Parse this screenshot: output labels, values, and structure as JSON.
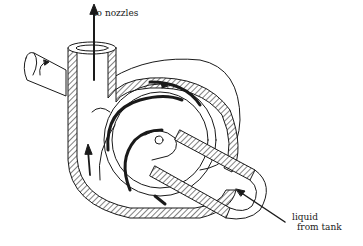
{
  "diagram": {
    "colors": {
      "ink": "#1a1a1a",
      "background": "#ffffff"
    },
    "labels": {
      "outlet": "to nozzles",
      "inlet_line1": "liquid",
      "inlet_line2": "from tank"
    },
    "components": [
      {
        "name": "drive-shaft",
        "description": "shaft entering from upper left with rotation arrow"
      },
      {
        "name": "discharge-pipe",
        "description": "vertical outlet pipe with upward flow arrow"
      },
      {
        "name": "volute-casing",
        "description": "hatched spiral casing"
      },
      {
        "name": "impeller",
        "description": "curved impeller vanes with rotation arrows"
      },
      {
        "name": "inlet-pipe",
        "description": "hatched suction pipe from lower right"
      }
    ],
    "arrows": [
      {
        "name": "outlet-flow-arrow",
        "direction": "up"
      },
      {
        "name": "inlet-flow-arrow",
        "direction": "up-left"
      },
      {
        "name": "shaft-rotation-arrow",
        "direction": "clockwise"
      },
      {
        "name": "casing-flow-arrow",
        "direction": "up"
      }
    ]
  }
}
